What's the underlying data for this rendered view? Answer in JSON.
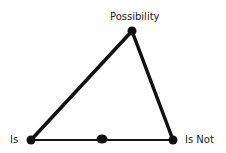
{
  "diagram": {
    "labels": {
      "top": "Possibility",
      "left": "Is",
      "right": "Is Not"
    },
    "nodes": {
      "top": {
        "x": 132,
        "y": 31
      },
      "left": {
        "x": 31,
        "y": 140
      },
      "right": {
        "x": 173,
        "y": 140
      },
      "middle": {
        "x": 102,
        "y": 139
      }
    },
    "colors": {
      "line": "#111111",
      "node": "#111111",
      "background": "#ffffff"
    }
  }
}
